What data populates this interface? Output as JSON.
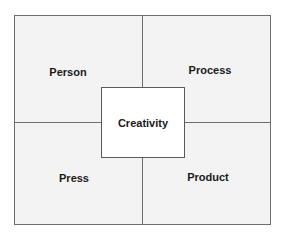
{
  "diagram": {
    "type": "four-quadrant",
    "center": {
      "label": "Creativity"
    },
    "quadrants": [
      {
        "position": "top-left",
        "label": "Person"
      },
      {
        "position": "top-right",
        "label": "Process"
      },
      {
        "position": "bottom-left",
        "label": "Press"
      },
      {
        "position": "bottom-right",
        "label": "Product"
      }
    ],
    "colors": {
      "quadrant_fill": "#f3f3f3",
      "center_fill": "#ffffff",
      "border": "#6e6e6e",
      "text": "#1a1a1a"
    }
  }
}
